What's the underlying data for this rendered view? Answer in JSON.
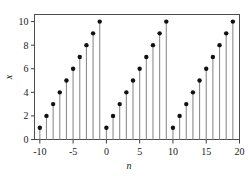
{
  "chart_data": {
    "type": "line",
    "plot_style": "stem",
    "title": "",
    "subtitle": "",
    "xlabel": "n",
    "ylabel": "x",
    "xlim": [
      -10.8,
      20.0
    ],
    "ylim": [
      0,
      10.6
    ],
    "xticks": [
      -10,
      -5,
      0,
      5,
      10,
      15,
      20
    ],
    "xticklabels": [
      "-10",
      "-5",
      "0",
      "5",
      "10",
      "15",
      "20"
    ],
    "yticks": [
      0,
      2,
      4,
      6,
      8,
      10
    ],
    "yticklabels": [
      "0",
      "2",
      "4",
      "6",
      "8",
      "10"
    ],
    "grid": false,
    "legend": null,
    "baseline": 0,
    "marker": "filled-circle",
    "marker_color": "#111111",
    "stem_color": "#8c8c8c",
    "frame_color": "#4d4d4d",
    "x": [
      -10,
      -9,
      -8,
      -7,
      -6,
      -5,
      -4,
      -3,
      -2,
      -1,
      0,
      1,
      2,
      3,
      4,
      5,
      6,
      7,
      8,
      9,
      10,
      11,
      12,
      13,
      14,
      15,
      16,
      17,
      18,
      19
    ],
    "values": [
      1,
      2,
      3,
      4,
      5,
      6,
      7,
      8,
      9,
      10,
      1,
      2,
      3,
      4,
      5,
      6,
      7,
      8,
      9,
      10,
      1,
      2,
      3,
      4,
      5,
      6,
      7,
      8,
      9,
      10
    ],
    "annotations": []
  }
}
